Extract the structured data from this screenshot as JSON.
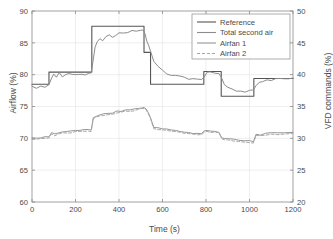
{
  "chart_data": {
    "type": "line",
    "title": "",
    "xlabel": "Time (s)",
    "ylabel": "Airflow (%)",
    "ylabel_right": "VFD commands (%)",
    "xlim": [
      0,
      1200
    ],
    "ylim": [
      60,
      90
    ],
    "ylim_right": [
      20,
      50
    ],
    "xticks": [
      0,
      200,
      400,
      600,
      800,
      1000,
      1200
    ],
    "yticks": [
      60,
      65,
      70,
      75,
      80,
      85,
      90
    ],
    "yticks_right": [
      20,
      25,
      30,
      35,
      40,
      45,
      50
    ],
    "grid": true,
    "legend_position": "top-right",
    "series": [
      {
        "name": "Reference",
        "axis": "left",
        "style": "solid",
        "color": "#555555",
        "width": 1.1,
        "kind": "step",
        "x": [
          0,
          78,
          78,
          275,
          275,
          515,
          515,
          545,
          545,
          790,
          790,
          870,
          870,
          1020,
          1020,
          1200
        ],
        "y": [
          78.5,
          78.5,
          80.4,
          80.4,
          87.6,
          87.6,
          83.5,
          83.5,
          78.5,
          78.5,
          80.5,
          80.5,
          76.6,
          76.6,
          79.4,
          79.4
        ]
      },
      {
        "name": "Total second air",
        "axis": "left",
        "style": "solid",
        "color": "#8c8c8c",
        "width": 1.0,
        "kind": "noisy",
        "x": [
          0,
          20,
          40,
          60,
          78,
          90,
          100,
          112,
          125,
          140,
          155,
          170,
          185,
          200,
          215,
          230,
          245,
          260,
          272,
          280,
          290,
          300,
          312,
          325,
          340,
          355,
          370,
          385,
          400,
          420,
          440,
          460,
          480,
          500,
          512,
          520,
          528,
          536,
          545,
          560,
          580,
          600,
          620,
          640,
          660,
          680,
          700,
          720,
          740,
          760,
          780,
          792,
          805,
          820,
          840,
          860,
          872,
          885,
          900,
          920,
          940,
          960,
          980,
          1000,
          1018,
          1030,
          1045,
          1060,
          1080,
          1100,
          1120,
          1140,
          1160,
          1180,
          1200
        ],
        "y": [
          78.3,
          78.0,
          78.2,
          78.1,
          78.3,
          79.6,
          80.2,
          79.6,
          80.2,
          79.7,
          80.0,
          80.1,
          79.9,
          80.1,
          80.0,
          80.2,
          80.1,
          80.2,
          80.3,
          82.0,
          84.2,
          85.2,
          85.5,
          85.4,
          85.9,
          86.1,
          86.0,
          86.3,
          86.5,
          86.6,
          86.7,
          86.8,
          86.9,
          87.0,
          86.9,
          86.3,
          85.4,
          84.6,
          83.6,
          82.2,
          81.2,
          80.6,
          80.2,
          79.9,
          79.8,
          79.7,
          79.5,
          79.4,
          79.3,
          79.2,
          79.1,
          79.6,
          80.4,
          80.3,
          80.4,
          80.3,
          79.4,
          78.4,
          77.9,
          77.6,
          77.4,
          77.5,
          77.3,
          77.4,
          77.6,
          78.4,
          78.8,
          79.0,
          79.2,
          79.0,
          79.3,
          79.4,
          79.3,
          79.5,
          79.4
        ]
      },
      {
        "name": "Airfan 1",
        "axis": "right",
        "style": "solid",
        "color": "#969696",
        "width": 1.0,
        "kind": "noisy",
        "x": [
          0,
          20,
          40,
          60,
          78,
          90,
          105,
          120,
          140,
          160,
          180,
          200,
          220,
          240,
          260,
          272,
          282,
          295,
          310,
          330,
          350,
          370,
          390,
          410,
          430,
          450,
          470,
          490,
          505,
          515,
          525,
          535,
          545,
          560,
          580,
          600,
          620,
          640,
          660,
          680,
          700,
          720,
          740,
          760,
          780,
          792,
          805,
          820,
          840,
          860,
          872,
          885,
          900,
          925,
          950,
          975,
          1000,
          1018,
          1030,
          1050,
          1075,
          1100,
          1130,
          1160,
          1200
        ],
        "y": [
          30.0,
          30.0,
          30.1,
          30.2,
          30.3,
          30.9,
          30.7,
          30.9,
          31.0,
          31.1,
          31.1,
          31.2,
          31.3,
          31.3,
          31.3,
          31.3,
          33.3,
          33.5,
          33.6,
          33.8,
          33.9,
          34.0,
          34.2,
          34.3,
          34.4,
          34.5,
          34.6,
          34.7,
          34.8,
          34.8,
          34.6,
          34.0,
          33.3,
          31.7,
          31.6,
          31.5,
          31.4,
          31.3,
          31.2,
          31.1,
          31.0,
          30.9,
          30.8,
          30.8,
          30.7,
          31.2,
          31.2,
          31.1,
          31.1,
          31.0,
          30.1,
          30.0,
          29.9,
          29.8,
          29.7,
          29.6,
          29.6,
          29.5,
          30.6,
          30.6,
          30.7,
          30.8,
          30.8,
          30.9,
          31.0
        ]
      },
      {
        "name": "Airfan 2",
        "axis": "right",
        "style": "dashed",
        "color": "#a8a8a8",
        "width": 1.0,
        "kind": "noisy",
        "x": [
          0,
          20,
          40,
          60,
          78,
          90,
          105,
          120,
          140,
          160,
          180,
          200,
          220,
          240,
          260,
          272,
          282,
          295,
          310,
          330,
          350,
          370,
          390,
          410,
          430,
          450,
          470,
          490,
          505,
          515,
          525,
          535,
          545,
          560,
          580,
          600,
          620,
          640,
          660,
          680,
          700,
          720,
          740,
          760,
          780,
          792,
          805,
          820,
          840,
          860,
          872,
          885,
          900,
          925,
          950,
          975,
          1000,
          1018,
          1030,
          1050,
          1075,
          1100,
          1130,
          1160,
          1200
        ],
        "y": [
          29.8,
          29.8,
          29.9,
          30.0,
          30.1,
          30.6,
          30.5,
          30.7,
          30.8,
          30.9,
          30.9,
          31.0,
          31.1,
          31.1,
          31.1,
          31.1,
          33.1,
          33.3,
          33.4,
          33.6,
          33.7,
          33.8,
          34.0,
          34.1,
          34.2,
          34.3,
          34.4,
          34.5,
          34.6,
          34.6,
          34.4,
          33.8,
          33.1,
          31.5,
          31.4,
          31.3,
          31.2,
          31.1,
          31.0,
          30.9,
          30.8,
          30.7,
          30.6,
          30.6,
          30.5,
          31.0,
          31.0,
          30.9,
          30.9,
          30.8,
          29.9,
          29.8,
          29.7,
          29.6,
          29.5,
          29.4,
          29.4,
          29.3,
          30.4,
          30.4,
          30.5,
          30.6,
          30.6,
          30.7,
          30.8
        ]
      }
    ]
  },
  "legend": {
    "entries": [
      {
        "label": "Reference",
        "style": "solid",
        "color": "#555555"
      },
      {
        "label": "Total second air",
        "style": "solid",
        "color": "#8c8c8c"
      },
      {
        "label": "Airfan 1",
        "style": "solid",
        "color": "#969696"
      },
      {
        "label": "Airfan 2",
        "style": "dashed",
        "color": "#a8a8a8"
      }
    ]
  },
  "colors": {
    "axis": "#8a8a8a",
    "grid": "#e2e2e2",
    "text": "#4a4a4a",
    "background": "#ffffff"
  }
}
